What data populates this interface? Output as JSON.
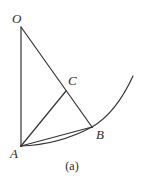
{
  "figure": {
    "caption": "(a)",
    "background_color": "#ffffff",
    "stroke_color": "#333333",
    "label_color": "#2b2b2b",
    "width": 144,
    "height": 186,
    "points": [
      {
        "id": "O",
        "label": "O",
        "x": 21,
        "y": 27
      },
      {
        "id": "C",
        "label": "C",
        "x": 66,
        "y": 91
      },
      {
        "id": "B",
        "label": "B",
        "x": 92,
        "y": 127
      },
      {
        "id": "A",
        "label": "A",
        "x": 21,
        "y": 146
      }
    ],
    "segments": [
      {
        "id": "OA",
        "from": "O",
        "to": "A",
        "kind": "straight"
      },
      {
        "id": "OB",
        "from": "O",
        "to": "B",
        "kind": "straight"
      },
      {
        "id": "AB",
        "from": "A",
        "to": "B",
        "kind": "straight"
      },
      {
        "id": "AC",
        "from": "A",
        "to": "C",
        "kind": "straight"
      }
    ],
    "curves": [
      {
        "id": "arc-ABtop",
        "description": "curve passing through A and B extending to upper right",
        "path": "M 21 146 Q 58 144 92 127 Q 116 112 133 76"
      }
    ],
    "labels": {
      "O": "O",
      "C": "C",
      "B": "B",
      "A": "A"
    }
  }
}
